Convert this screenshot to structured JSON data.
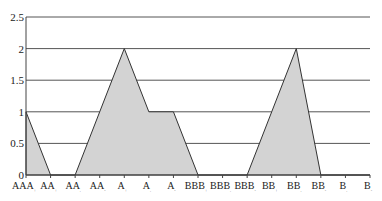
{
  "chart_data": {
    "type": "area",
    "title": "",
    "xlabel": "",
    "ylabel": "",
    "ylim": [
      0,
      2.5
    ],
    "yticks": [
      "0",
      "0.5",
      "1",
      "1.5",
      "2",
      "2.5"
    ],
    "grid": true,
    "legend": null,
    "categories": [
      "AAA",
      "AA",
      "AA",
      "AA",
      "A",
      "A",
      "A",
      "BBB",
      "BBB",
      "BBB",
      "BB",
      "BB",
      "BB",
      "B",
      "B"
    ],
    "category_subscripts": [
      "+",
      "+",
      "",
      "-",
      "+",
      "",
      "-",
      "+",
      "",
      "-",
      "+",
      "",
      "-",
      "",
      "-"
    ],
    "values": [
      1,
      0,
      0,
      1,
      2,
      1,
      1,
      0,
      0,
      0,
      1,
      2,
      0,
      0,
      0
    ],
    "fill_color": "#d3d3d3",
    "line_color": "#333333",
    "grid_color": "#555555"
  }
}
